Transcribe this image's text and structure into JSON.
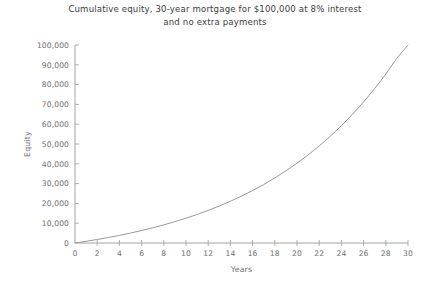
{
  "chart_data": {
    "type": "line",
    "title": "Cumulative equity, 30-year mortgage for $100,000 at 8% interest and no extra payments",
    "title_lines": [
      "Cumulative equity, 30-year mortgage for $100,000 at 8% interest",
      "and no extra payments"
    ],
    "xlabel": "Years",
    "ylabel": "Equity",
    "xlim": [
      0,
      30
    ],
    "ylim": [
      0,
      100000
    ],
    "grid": false,
    "legend": false,
    "xticks": [
      0,
      2,
      4,
      6,
      8,
      10,
      12,
      14,
      16,
      18,
      20,
      22,
      24,
      26,
      28,
      30
    ],
    "xtick_labels": [
      "0",
      "2",
      "4",
      "6",
      "8",
      "10",
      "12",
      "14",
      "16",
      "18",
      "20",
      "22",
      "24",
      "26",
      "28",
      "30"
    ],
    "yticks": [
      0,
      10000,
      20000,
      30000,
      40000,
      50000,
      60000,
      70000,
      80000,
      90000,
      100000
    ],
    "ytick_labels": [
      "0",
      "10,000",
      "20,000",
      "30,000",
      "40,000",
      "50,000",
      "60,000",
      "70,000",
      "80,000",
      "90,000",
      "100,000"
    ],
    "series": [
      {
        "name": "Cumulative equity",
        "color": "#8c8c8c",
        "x": [
          0,
          1,
          2,
          3,
          4,
          5,
          6,
          7,
          8,
          9,
          10,
          11,
          12,
          13,
          14,
          15,
          16,
          17,
          18,
          19,
          20,
          21,
          22,
          23,
          24,
          25,
          26,
          27,
          28,
          29,
          30
        ],
        "y": [
          0,
          853,
          1777,
          2777,
          3860,
          5032,
          6302,
          7677,
          9166,
          10778,
          12524,
          14415,
          16462,
          18679,
          21080,
          23680,
          26496,
          29546,
          32848,
          36424,
          40296,
          44488,
          49028,
          53944,
          59267,
          65032,
          71274,
          78033,
          85352,
          93278,
          100000
        ]
      }
    ]
  },
  "axes_geometry": {
    "plot_left": 75,
    "plot_right": 408,
    "plot_top": 45,
    "plot_bottom": 243
  }
}
